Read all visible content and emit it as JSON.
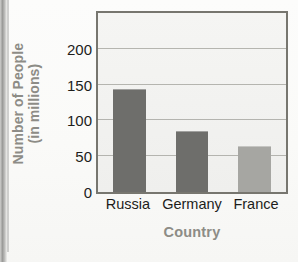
{
  "chart_data": {
    "type": "bar",
    "title": "",
    "xlabel": "Country",
    "ylabel_line1": "Number of People",
    "ylabel_line2": "(in millions)",
    "categories": [
      "Russia",
      "Germany",
      "France"
    ],
    "values": [
      144,
      85,
      64
    ],
    "yticks": [
      0,
      50,
      100,
      150,
      200
    ],
    "ylim": [
      0,
      250
    ],
    "grid": true,
    "legend": "none",
    "bar_colors": [
      "#6e6e6b",
      "#6e6e6b",
      "#a6a6a2"
    ],
    "plot_background": "#f2f2f0",
    "frame_color": "#77766f",
    "gridline_color": "#a9a9a3",
    "tick_label_color": "#1d1d1b",
    "axis_title_color": "#8d8c86"
  },
  "page": {
    "bleed_top": "",
    "bleed_mid1": "",
    "bleed_mid2": ""
  }
}
